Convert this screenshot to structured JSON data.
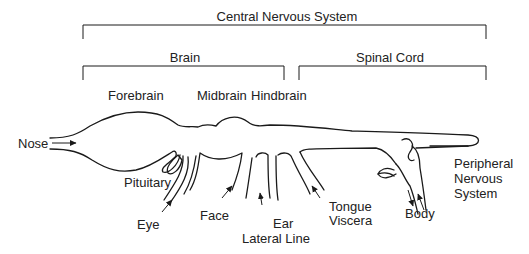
{
  "diagram": {
    "type": "anatomical-schematic",
    "brackets": {
      "cns": {
        "label": "Central Nervous System"
      },
      "brain": {
        "label": "Brain"
      },
      "spinal_cord": {
        "label": "Spinal Cord"
      }
    },
    "brain_regions": [
      {
        "label": "Forebrain"
      },
      {
        "label": "Midbrain"
      },
      {
        "label": "Hindbrain"
      }
    ],
    "inputs": [
      {
        "label": "Nose"
      },
      {
        "label": "Pituitary"
      },
      {
        "label": "Eye"
      },
      {
        "label": "Face"
      },
      {
        "label": "Ear"
      },
      {
        "label": "Lateral Line"
      },
      {
        "label": "Tongue"
      },
      {
        "label": "Viscera"
      },
      {
        "label": "Body"
      }
    ],
    "pns": {
      "line1": "Peripheral",
      "line2": "Nervous",
      "line3": "System"
    }
  }
}
